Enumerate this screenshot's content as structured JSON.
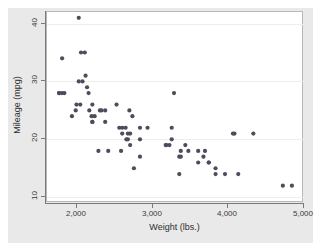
{
  "chart_data": {
    "type": "scatter",
    "title": "",
    "xlabel": "Weight (lbs.)",
    "ylabel": "Mileage (mpg)",
    "xlim": [
      1600,
      5000
    ],
    "ylim": [
      9,
      42
    ],
    "xticks": [
      2000,
      3000,
      4000,
      5000
    ],
    "xticklabels": [
      "2,000",
      "3,000",
      "4,000",
      "5,000"
    ],
    "yticks": [
      10,
      20,
      30,
      40
    ],
    "yticklabels": [
      "10",
      "20",
      "30",
      "40"
    ],
    "grid": "horizontal",
    "legend": "none",
    "marker_color": "#4c4c5c",
    "plot_bg": "#ffffff",
    "graph_bg": "#e9e9e9",
    "series": [
      {
        "name": "Mileage vs Weight",
        "x": [
          2930,
          3350,
          2640,
          3250,
          4080,
          3670,
          3690,
          3180,
          3220,
          4060,
          3600,
          3740,
          4840,
          4720,
          3830,
          2580,
          3350,
          2670,
          2595,
          2700,
          2556,
          2200,
          2150,
          2670,
          2595,
          2700,
          3955,
          3830,
          2100,
          2200,
          2830,
          3250,
          2690,
          3370,
          2020,
          2130,
          1800,
          1760,
          2050,
          1830,
          2410,
          2200,
          2520,
          2300,
          2230,
          2370,
          2730,
          2830,
          3280,
          3430,
          3370,
          3470,
          3600,
          3740,
          4130,
          4330,
          2110,
          2320,
          2160,
          2040,
          1930,
          1990,
          3170,
          2190,
          2370,
          2020,
          2280,
          1800,
          1760,
          1980,
          2830,
          2070,
          2650,
          2750
        ],
        "y": [
          22,
          17,
          22,
          22,
          21,
          17,
          18,
          19,
          19,
          21,
          18,
          16,
          12,
          12,
          14,
          18,
          14,
          20,
          21,
          21,
          22,
          26,
          28,
          21,
          22,
          19,
          14,
          15,
          35,
          23,
          22,
          20,
          25,
          18,
          30,
          29,
          34,
          28,
          35,
          28,
          18,
          23,
          26,
          25,
          24,
          25,
          24,
          17,
          28,
          19,
          17,
          18,
          16,
          16,
          14,
          21,
          31,
          25,
          25,
          26,
          24,
          26,
          19,
          24,
          23,
          41,
          18,
          28,
          28,
          25,
          20,
          30,
          20,
          15
        ]
      }
    ]
  },
  "axes": {
    "x_tick_labels": [
      "2,000",
      "3,000",
      "4,000",
      "5,000"
    ],
    "y_tick_labels": [
      "10",
      "20",
      "30",
      "40"
    ],
    "x_axis_title": "Weight (lbs.)",
    "y_axis_title": "Mileage (mpg)"
  }
}
